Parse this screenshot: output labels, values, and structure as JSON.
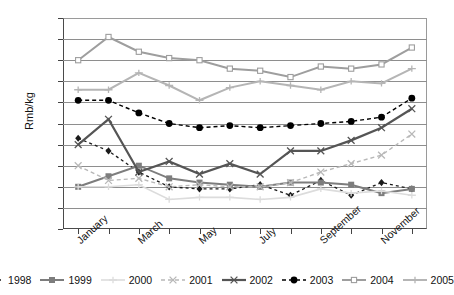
{
  "chart_data": {
    "type": "line",
    "title": "",
    "xlabel": "",
    "ylabel": "Rmb/kg",
    "ylim": [
      12.5,
      17.5
    ],
    "ytick_step": 0.5,
    "grid": true,
    "legend_position": "bottom",
    "categories": [
      "January",
      "February",
      "March",
      "April",
      "May",
      "June",
      "July",
      "August",
      "September",
      "October",
      "November",
      "December"
    ],
    "tick_labels": [
      "January",
      "",
      "March",
      "",
      "May",
      "",
      "July",
      "",
      "September",
      "",
      "November",
      ""
    ],
    "ytick_labels": [
      "12.5",
      "13.0",
      "13.5",
      "14.0",
      "14.5",
      "15.0",
      "15.5",
      "16.0",
      "16.5",
      "17.0",
      "17.5"
    ],
    "series": [
      {
        "name": "1998",
        "color": "#1a1a1a",
        "dash": "3,3",
        "marker": "diamond",
        "width": 1.3,
        "values": [
          14.65,
          14.35,
          13.85,
          13.5,
          13.45,
          13.45,
          13.55,
          13.3,
          13.65,
          13.3,
          13.6,
          13.45
        ]
      },
      {
        "name": "1999",
        "color": "#7d7d7d",
        "dash": "none",
        "marker": "square",
        "width": 2.0,
        "values": [
          13.5,
          13.75,
          14.0,
          13.7,
          13.6,
          13.55,
          13.5,
          13.6,
          13.6,
          13.55,
          13.35,
          13.45
        ]
      },
      {
        "name": "2000",
        "color": "#dcdcdc",
        "dash": "none",
        "marker": "plus",
        "width": 1.6,
        "values": [
          13.5,
          13.5,
          13.55,
          13.2,
          13.25,
          13.25,
          13.2,
          13.25,
          13.45,
          13.35,
          13.4,
          13.3
        ]
      },
      {
        "name": "2001",
        "color": "#b8b8b8",
        "dash": "4,3",
        "marker": "cross",
        "width": 1.4,
        "values": [
          14.0,
          13.65,
          13.7,
          13.5,
          13.55,
          13.5,
          13.5,
          13.6,
          13.85,
          14.05,
          14.25,
          14.75
        ]
      },
      {
        "name": "2002",
        "color": "#555555",
        "dash": "none",
        "marker": "cross",
        "width": 2.2,
        "values": [
          14.5,
          15.1,
          13.85,
          14.1,
          13.8,
          14.05,
          13.8,
          14.35,
          14.35,
          14.6,
          14.9,
          15.35
        ]
      },
      {
        "name": "2003",
        "color": "#000000",
        "dash": "4,3",
        "marker": "circle",
        "width": 1.4,
        "values": [
          15.55,
          15.55,
          15.25,
          15.0,
          14.9,
          14.95,
          14.9,
          14.95,
          15.0,
          15.05,
          15.15,
          15.6
        ]
      },
      {
        "name": "2004",
        "color": "#9e9e9e",
        "dash": "none",
        "marker": "square-open",
        "width": 2.0,
        "values": [
          16.5,
          17.05,
          16.7,
          16.55,
          16.5,
          16.3,
          16.25,
          16.1,
          16.35,
          16.3,
          16.4,
          16.8
        ]
      },
      {
        "name": "2005",
        "color": "#b5b5b5",
        "dash": "none",
        "marker": "plus",
        "width": 2.0,
        "values": [
          15.8,
          15.8,
          16.2,
          15.9,
          15.55,
          15.85,
          16.0,
          15.9,
          15.8,
          16.0,
          15.95,
          16.3
        ]
      }
    ]
  }
}
